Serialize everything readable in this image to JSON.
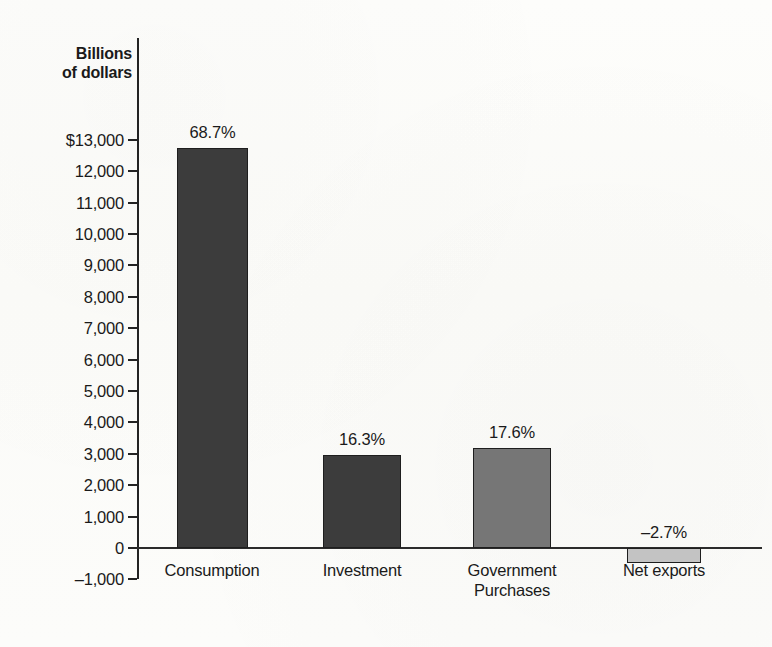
{
  "chart_data": {
    "type": "bar",
    "title": "",
    "subtitle": "",
    "xlabel": "",
    "ylabel": "Billions of dollars",
    "ylabel_lines": [
      "Billions",
      "of dollars"
    ],
    "categories": [
      "Consumption",
      "Investment",
      "Government Purchases",
      "Net exports"
    ],
    "category_lines": [
      [
        "Consumption"
      ],
      [
        "Investment"
      ],
      [
        "Government",
        "Purchases"
      ],
      [
        "Net exports"
      ]
    ],
    "values": [
      12750,
      2950,
      3180,
      -490
    ],
    "data_labels": [
      "68.7%",
      "16.3%",
      "17.6%",
      "–2.7%"
    ],
    "share_percent": [
      68.7,
      16.3,
      17.6,
      -2.7
    ],
    "bar_colors": [
      "#3c3c3c",
      "#3c3c3c",
      "#767676",
      "#c3c3c3"
    ],
    "ylim": [
      -1000,
      13000
    ],
    "ytick_values": [
      13000,
      12000,
      11000,
      10000,
      9000,
      8000,
      7000,
      6000,
      5000,
      4000,
      3000,
      2000,
      1000,
      0,
      -1000
    ],
    "ytick_labels": [
      "$13,000",
      "12,000",
      "11,000",
      "10,000",
      "9,000",
      "8,000",
      "7,000",
      "6,000",
      "5,000",
      "4,000",
      "3,000",
      "2,000",
      "1,000",
      "0",
      "–1,000"
    ],
    "grid": false,
    "legend": false,
    "legend_position": "none",
    "units": "Billions of dollars",
    "zero_baseline": true
  },
  "figure": {
    "background_color": "#fdfdfb",
    "axis_color": "#232323",
    "text_color": "#1a1a1a"
  }
}
